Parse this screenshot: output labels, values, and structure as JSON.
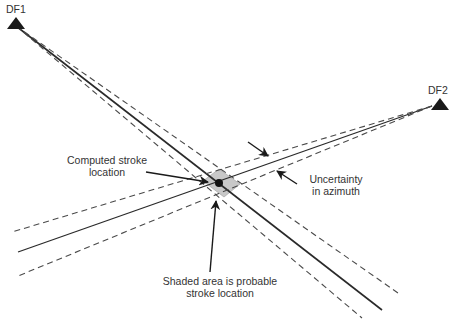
{
  "stations": [
    {
      "id": "df1",
      "label": "DF1"
    },
    {
      "id": "df2",
      "label": "DF2"
    }
  ],
  "annotations": {
    "computed_stroke": {
      "line1": "Computed stroke",
      "line2": "location"
    },
    "uncertainty": {
      "line1": "Uncertainty",
      "line2": "in azimuth"
    },
    "shaded_area": {
      "line1": "Shaded area is probable",
      "line2": "stroke location"
    }
  },
  "colors": {
    "line": "#2a2a2a",
    "dashed": "#4a4a4a",
    "shade": "#c8c8c8",
    "text": "#333333"
  }
}
